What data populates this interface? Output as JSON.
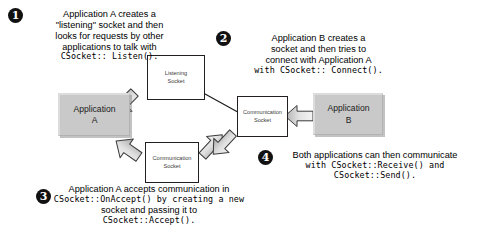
{
  "diagram": {
    "colors": {
      "app_fill": "#c9c9c9",
      "socket_fill": "#ffffff",
      "stroke": "#231f20",
      "arrow_fill": "#d8d8d8",
      "badge_fill": "#111111",
      "background": "#ffffff"
    },
    "nodes": [
      {
        "id": "listening-socket",
        "line1": "Listening",
        "line2": "Socket"
      },
      {
        "id": "application-a",
        "line1": "Application",
        "line2": "A"
      },
      {
        "id": "communication-socket-a",
        "line1": "Communication",
        "line2": "Socket"
      },
      {
        "id": "communication-socket-b",
        "line1": "Communication",
        "line2": "Socket"
      },
      {
        "id": "application-b",
        "line1": "Application",
        "line2": "B"
      }
    ],
    "steps": [
      {
        "number": "1",
        "lines": [
          {
            "text": "Application A creates a",
            "code": false
          },
          {
            "text": "\"listening\" socket and then",
            "code": false
          },
          {
            "text": "looks for requests by other",
            "code": false
          },
          {
            "text": "applications to talk with",
            "code": false
          },
          {
            "text": "CSocket:: Listen().",
            "code": true
          }
        ]
      },
      {
        "number": "2",
        "lines": [
          {
            "text": "Application B creates a",
            "code": false
          },
          {
            "text": "socket and then tries to",
            "code": false
          },
          {
            "text": "connect with Application A",
            "code": false
          },
          {
            "text": "with CSocket:: Connect().",
            "code": true
          }
        ]
      },
      {
        "number": "3",
        "lines": [
          {
            "text": "Application A accepts communication in",
            "code": false
          },
          {
            "text": "CSocket::OnAccept() by creating a new",
            "code": true
          },
          {
            "text": "socket and passing it to",
            "code": false
          },
          {
            "text": "CSocket::Accept().",
            "code": true
          }
        ]
      },
      {
        "number": "4",
        "lines": [
          {
            "text": "Both applications can then communicate",
            "code": false
          },
          {
            "text": "with CSocket::Receive() and",
            "code": true
          },
          {
            "text": "CSocket::Send().",
            "code": true
          }
        ]
      }
    ]
  }
}
